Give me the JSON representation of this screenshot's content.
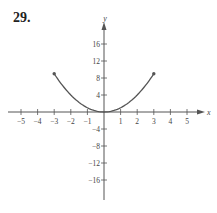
{
  "problem_number": "29.",
  "chart_data": {
    "type": "line",
    "title": "29.",
    "xlabel": "x",
    "ylabel": "y",
    "xlim": [
      -5.5,
      5.7
    ],
    "ylim": [
      -19,
      20
    ],
    "x_ticks": [
      -5,
      -4,
      -3,
      -2,
      -1,
      1,
      2,
      3,
      4,
      5
    ],
    "y_ticks": [
      16,
      12,
      8,
      4,
      -4,
      -8,
      -12,
      -16
    ],
    "grid": false,
    "series": [
      {
        "name": "y = x^2",
        "x": [
          -3,
          -2.5,
          -2,
          -1.5,
          -1,
          -0.5,
          0,
          0.5,
          1,
          1.5,
          2,
          2.5,
          3
        ],
        "values": [
          9,
          6.25,
          4,
          2.25,
          1,
          0.25,
          0,
          0.25,
          1,
          2.25,
          4,
          6.25,
          9
        ],
        "endpoints": [
          [
            -3,
            9
          ],
          [
            3,
            9
          ]
        ],
        "color": "#555555"
      }
    ]
  },
  "colors": {
    "axis": "#555555",
    "curve": "#555555",
    "text": "#444444"
  }
}
